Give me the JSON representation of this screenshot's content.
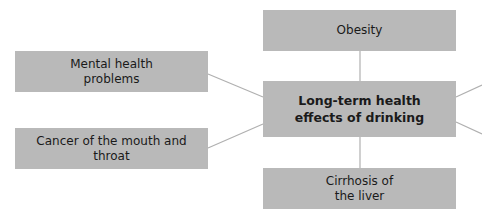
{
  "diagram": {
    "type": "mind-map",
    "center": {
      "label": "Long-term health effects of drinking"
    },
    "nodes": [
      {
        "id": "obesity",
        "label": "Obesity"
      },
      {
        "id": "mental",
        "label": "Mental health problems"
      },
      {
        "id": "cancer",
        "label": "Cancer of the mouth and throat"
      },
      {
        "id": "cirrhosis",
        "label": "Cirrhosis of the liver"
      }
    ],
    "colors": {
      "box_fill": "#b9b9b9",
      "connector": "#b0b0b0",
      "text": "#1a1a1a"
    }
  }
}
